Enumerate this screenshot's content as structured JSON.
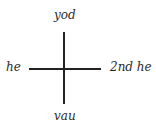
{
  "diagram": {
    "labels": {
      "top": "yod",
      "left": "he",
      "right": "2nd he",
      "bottom": "vau"
    }
  }
}
